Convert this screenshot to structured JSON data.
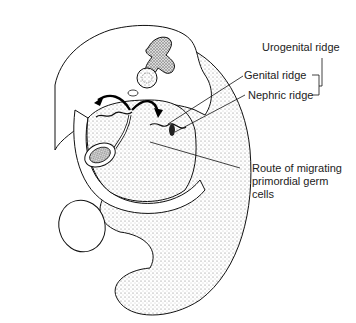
{
  "figure": {
    "type": "anatomical-illustration",
    "labels": {
      "urogenital_ridge": "Urogenital ridge",
      "genital_ridge": "Genital ridge",
      "nephric_ridge": "Nephric ridge",
      "route": "Route of migrating primordial germ cells"
    },
    "colors": {
      "line": "#111111",
      "stipple": "#888888",
      "background": "#ffffff"
    }
  }
}
